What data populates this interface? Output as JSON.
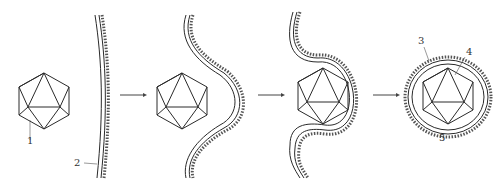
{
  "diagram": {
    "type": "process",
    "stages": [
      {
        "id": 1,
        "name": "capsid-approaching-membrane"
      },
      {
        "id": 2,
        "name": "membrane-indenting"
      },
      {
        "id": 3,
        "name": "capsid-being-wrapped"
      },
      {
        "id": 4,
        "name": "enveloped-virion-released"
      }
    ],
    "labels": {
      "l1": "1",
      "l2": "2",
      "l3": "3",
      "l4": "4",
      "l5": "5"
    },
    "arrows": 3,
    "colors": {
      "line": "#2a2a2a",
      "spikes": "#555555",
      "arrow": "#444444",
      "background": "#ffffff"
    }
  }
}
